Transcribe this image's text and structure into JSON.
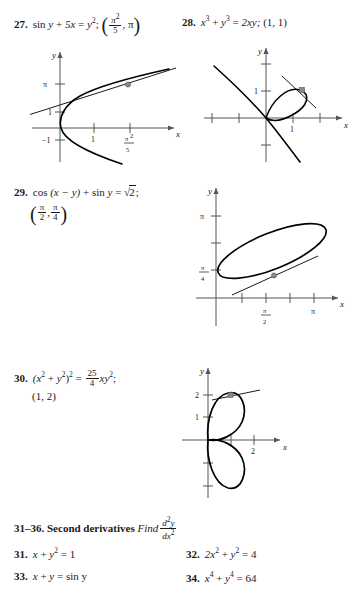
{
  "page": {
    "kind": "textbook-exercise-page",
    "ink_color": "#1a1a1a",
    "curve_color": "#000000",
    "axis_color": "#555555",
    "point_color": "#808080"
  },
  "exercises_with_graphs": [
    {
      "number": "27.",
      "equation_html": "sin y + 5x = y<sup>2</sup>;",
      "point_numerator": "π<sup>2</sup>",
      "point_denominator": "5",
      "point_second": "π",
      "eq_parts": {
        "fn": "sin",
        "var1": "y",
        "plus": "+",
        "term": "5x",
        "equals": "=",
        "rhs": "y",
        "rhs_exp": "2",
        "semicolon": ";"
      },
      "graph": {
        "x_axis_label": "x",
        "y_axis_label": "y",
        "y_ticks": [
          "π",
          "1",
          "−1"
        ],
        "x_ticks": [
          "1",
          "π²/5"
        ],
        "x_tick_frac_num": "π",
        "x_tick_frac_num_sup": "2",
        "x_tick_frac_den": "5",
        "description": "rightward-opening curve with tangent line at marked point"
      }
    },
    {
      "number": "28.",
      "eq_parts": {
        "x": "x",
        "x_exp": "3",
        "plus": "+",
        "y": "y",
        "y_exp": "3",
        "equals": "=",
        "rhs": "2xy;",
        "point": "(1, 1)"
      },
      "graph": {
        "x_axis_label": "x",
        "y_axis_label": "y",
        "y_ticks": [
          "1"
        ],
        "x_ticks": [
          "1"
        ],
        "description": "folium of Descartes with loop and tangent line at (1,1)"
      }
    },
    {
      "number": "29.",
      "eq_parts": {
        "fn1": "cos",
        "arg": "(x − y)",
        "plus": "+",
        "fn2": "sin",
        "var": "y",
        "equals": "=",
        "radicand": "2",
        "semicolon": ";"
      },
      "point_first_num": "π",
      "point_first_den": "2",
      "point_second_num": "π",
      "point_second_den": "4",
      "graph": {
        "x_axis_label": "x",
        "y_axis_label": "y",
        "y_ticks": [
          "π",
          "π/4"
        ],
        "y_tick_frac_num": "π",
        "y_tick_frac_den": "4",
        "x_ticks": [
          "π/2",
          "π"
        ],
        "x_tick_frac_num": "π",
        "x_tick_frac_den": "2",
        "x_tick_pi": "π",
        "description": "tilted elongated oval with tangent line at marked point"
      }
    },
    {
      "number": "30.",
      "eq_parts": {
        "lhs_open": "(x",
        "lhs_exp1": "2",
        "plus": "+",
        "lhs_y": "y",
        "lhs_exp2": "2",
        "lhs_close": ")",
        "lhs_outer_exp": "2",
        "equals": "=",
        "frac_num": "25",
        "frac_den": "4",
        "rhs": "xy",
        "rhs_exp": "2",
        "semicolon": ";"
      },
      "point": "(1, 2)",
      "graph": {
        "x_axis_label": "x",
        "y_axis_label": "y",
        "y_ticks": [
          "2",
          "1"
        ],
        "x_ticks": [
          "2"
        ],
        "description": "two-petal rose curve with tangent line at (1,2)"
      }
    }
  ],
  "section": {
    "range": "31–36.",
    "title": "Second derivatives",
    "instruction": "Find",
    "frac_numerator": "d²y",
    "frac_denominator": "dx²"
  },
  "exercises_plain": [
    {
      "number": "31.",
      "equation": "x + y² = 1",
      "parts": {
        "a": "x",
        "plus": "+",
        "b": "y",
        "b_exp": "2",
        "eq": "=",
        "rhs": "1"
      }
    },
    {
      "number": "32.",
      "equation": "2x² + y² = 4",
      "parts": {
        "a": "2x",
        "a_exp": "2",
        "plus": "+",
        "b": "y",
        "b_exp": "2",
        "eq": "=",
        "rhs": "4"
      }
    },
    {
      "number": "33.",
      "equation": "x + y = sin y",
      "parts": {
        "a": "x",
        "plus": "+",
        "b": "y",
        "eq": "=",
        "rhs": "sin y"
      }
    },
    {
      "number": "34.",
      "equation": "x⁴ + y⁴ = 64",
      "parts": {
        "a": "x",
        "a_exp": "4",
        "plus": "+",
        "b": "y",
        "b_exp": "4",
        "eq": "=",
        "rhs": "64"
      }
    }
  ]
}
